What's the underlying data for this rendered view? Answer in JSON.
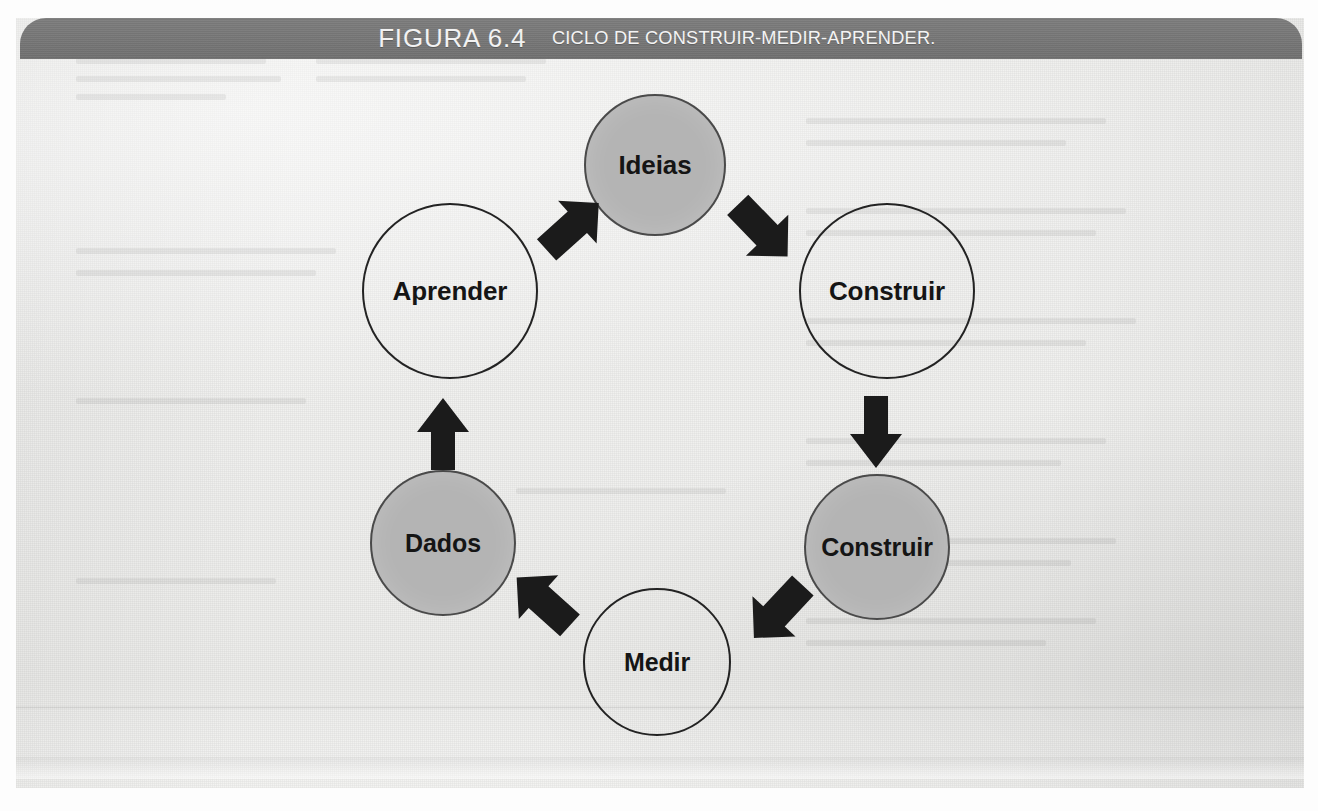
{
  "figure": {
    "label": "FIGURA 6.4",
    "caption": "CICLO DE CONSTRUIR-MEDIR-APRENDER.",
    "bar_color": "#767676",
    "bar_text_color": "#f2f2f2",
    "paper_color": "#efefed"
  },
  "diagram": {
    "type": "cycle",
    "node_fill_gray": "#b4b4b4",
    "node_fill_white": "#efefed",
    "node_stroke": "#232323",
    "arrow_color": "#1b1b1b",
    "nodes": [
      {
        "id": "ideias",
        "label": "Ideias",
        "fill": "gray",
        "position": "top-center"
      },
      {
        "id": "construir-top",
        "label": "Construir",
        "fill": "white",
        "position": "top-right"
      },
      {
        "id": "construir-bottom",
        "label": "Construir",
        "fill": "gray",
        "position": "bottom-right"
      },
      {
        "id": "medir",
        "label": "Medir",
        "fill": "white",
        "position": "bottom-center"
      },
      {
        "id": "dados",
        "label": "Dados",
        "fill": "gray",
        "position": "bottom-left"
      },
      {
        "id": "aprender",
        "label": "Aprender",
        "fill": "white",
        "position": "top-left"
      }
    ],
    "arrows": [
      {
        "id": "ideias-to-construir-top",
        "from": "ideias",
        "to": "construir-top",
        "direction": "down-right"
      },
      {
        "id": "construir-top-to-construir",
        "from": "construir-top",
        "to": "construir-bottom",
        "direction": "down"
      },
      {
        "id": "construir-bottom-to-medir",
        "from": "construir-bottom",
        "to": "medir",
        "direction": "down-left"
      },
      {
        "id": "medir-to-dados",
        "from": "medir",
        "to": "dados",
        "direction": "up-left"
      },
      {
        "id": "dados-to-aprender",
        "from": "dados",
        "to": "aprender",
        "direction": "up"
      },
      {
        "id": "aprender-to-ideias",
        "from": "aprender",
        "to": "ideias",
        "direction": "up-right"
      }
    ]
  }
}
